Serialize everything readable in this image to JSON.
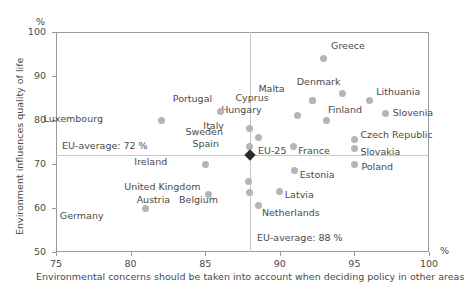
{
  "chart_data": {
    "type": "scatter",
    "title": "",
    "xlabel": "Environmental concerns should be taken into account when deciding policy in other areas",
    "ylabel": "Environment influences quality of life",
    "x_unit": "%",
    "y_unit": "%",
    "xlim": [
      75,
      100
    ],
    "ylim": [
      50,
      100
    ],
    "xticks": [
      "75",
      "80",
      "85",
      "90",
      "95",
      "100"
    ],
    "yticks": [
      "50",
      "60",
      "70",
      "80",
      "90",
      "100"
    ],
    "grid": false,
    "legend": "none",
    "reference_lines": [
      {
        "name": "eu-average-y",
        "orientation": "horizontal",
        "value": 72,
        "label": "EU-average: 72 %"
      },
      {
        "name": "eu-average-x",
        "orientation": "vertical",
        "value": 88,
        "label": "EU-average: 88 %"
      }
    ],
    "points": [
      {
        "name": "Greece",
        "x": 92.9,
        "y": 94.0,
        "label_dx": 8,
        "label_dy": -12
      },
      {
        "name": "Denmark",
        "x": 94.2,
        "y": 86.0,
        "label_dx": -2,
        "label_dy": -12
      },
      {
        "name": "Malta",
        "x": 92.2,
        "y": 84.5,
        "label_dx": -28,
        "label_dy": -11
      },
      {
        "name": "Cyprus",
        "x": 92.2,
        "y": 84.5,
        "label_dx": -44,
        "label_dy": -2
      },
      {
        "name": "Lithuania",
        "x": 96.0,
        "y": 84.5,
        "label_dx": 7,
        "label_dy": -8
      },
      {
        "name": "Slovenia",
        "x": 97.1,
        "y": 81.4,
        "label_dx": 7,
        "label_dy": -1
      },
      {
        "name": "Finland",
        "x": 93.1,
        "y": 80.0,
        "label_dx": 2,
        "label_dy": -10
      },
      {
        "name": "Hungary",
        "x": 91.2,
        "y": 81.0,
        "label_dx": -36,
        "label_dy": -6
      },
      {
        "name": "Portugal",
        "x": 86.0,
        "y": 82.0,
        "label_dx": -8,
        "label_dy": -12
      },
      {
        "name": "Luxembourg",
        "x": 82.1,
        "y": 79.8,
        "label_dx": -59,
        "label_dy": -2
      },
      {
        "name": "Italy",
        "x": 88.0,
        "y": 78.0,
        "label_dx": -26,
        "label_dy": -3
      },
      {
        "name": "Sweden",
        "x": 88.6,
        "y": 76.0,
        "label_dx": -36,
        "label_dy": -6
      },
      {
        "name": "Czech Republic",
        "x": 95.0,
        "y": 75.5,
        "label_dx": 6,
        "label_dy": -5
      },
      {
        "name": "Slovakia",
        "x": 95.0,
        "y": 73.5,
        "label_dx": 6,
        "label_dy": 3
      },
      {
        "name": "France",
        "x": 90.9,
        "y": 74.0,
        "label_dx": 5,
        "label_dy": 5
      },
      {
        "name": "Spain",
        "x": 88.0,
        "y": 74.0,
        "label_dx": -31,
        "label_dy": -2
      },
      {
        "name": "Poland",
        "x": 95.0,
        "y": 70.0,
        "label_dx": 7,
        "label_dy": 3
      },
      {
        "name": "Ireland",
        "x": 85.0,
        "y": 70.0,
        "label_dx": -38,
        "label_dy": -2
      },
      {
        "name": "Estonia",
        "x": 91.0,
        "y": 68.5,
        "label_dx": 5,
        "label_dy": 4
      },
      {
        "name": "United Kingdom",
        "x": 87.9,
        "y": 66.0,
        "label_dx": -48,
        "label_dy": 5
      },
      {
        "name": "Latvia",
        "x": 90.0,
        "y": 63.8,
        "label_dx": 5,
        "label_dy": 4
      },
      {
        "name": "Belgium",
        "x": 88.0,
        "y": 63.5,
        "label_dx": -32,
        "label_dy": 7
      },
      {
        "name": "Austria",
        "x": 85.2,
        "y": 63.0,
        "label_dx": -38,
        "label_dy": 5
      },
      {
        "name": "Netherlands",
        "x": 88.6,
        "y": 60.5,
        "label_dx": 3,
        "label_dy": 7
      },
      {
        "name": "Germany",
        "x": 81.0,
        "y": 60.0,
        "label_dx": -42,
        "label_dy": 8
      }
    ],
    "highlight_point": {
      "name": "EU-25",
      "x": 88.0,
      "y": 72.0,
      "label_dx": 8,
      "label_dy": -4,
      "color": "#2b2b2b"
    }
  }
}
